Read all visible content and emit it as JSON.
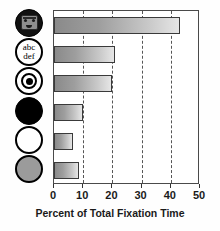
{
  "chart_data": {
    "type": "bar",
    "orientation": "horizontal",
    "title": "",
    "xlabel": "Percent of Total Fixation Time",
    "ylabel": "",
    "xlim": [
      0,
      50
    ],
    "xticks": [
      0,
      10,
      20,
      30,
      40,
      50
    ],
    "xticklabels": [
      "0",
      "10",
      "20",
      "30",
      "40",
      "50"
    ],
    "grid": "vertical-dashed",
    "legend": "none",
    "categories": [
      "face-image",
      "text-abc-def",
      "bullseye-concentric-circles",
      "black-filled-circle",
      "white-circle",
      "gray-filled-circle"
    ],
    "values": [
      43,
      21,
      20,
      10,
      6.5,
      8.5
    ]
  },
  "icons": [
    {
      "name": "face-icon",
      "type": "face",
      "label": ""
    },
    {
      "name": "text-icon",
      "type": "text",
      "line1": "abc",
      "line2": "def"
    },
    {
      "name": "bullseye-icon",
      "type": "bullseye",
      "label": ""
    },
    {
      "name": "black-circle-icon",
      "type": "black",
      "label": ""
    },
    {
      "name": "white-circle-icon",
      "type": "white",
      "label": ""
    },
    {
      "name": "gray-circle-icon",
      "type": "gray",
      "label": ""
    }
  ],
  "colors": {
    "bar_dark": "#8a8a8a",
    "bar_light": "#e6e6e6",
    "bar_border": "#3a3a3a",
    "gridline": "#555555",
    "frame": "#4a4a4a",
    "text": "#1a1a1a",
    "gray_circle": "#9b9b9b",
    "background": "#ffffff"
  }
}
